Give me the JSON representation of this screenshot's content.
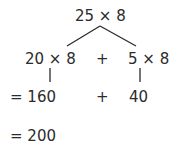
{
  "top_expression": "25 × 8",
  "left_branch": "20 × 8",
  "plus_1": "+",
  "right_branch": "5 × 8",
  "left_result": "= 160",
  "plus_2": "+",
  "right_result": "40",
  "final_result": "= 200",
  "line_color": "#2b2b2b"
}
